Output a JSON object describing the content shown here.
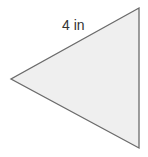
{
  "diagram": {
    "shape": "triangle",
    "side_label": "4 in",
    "fill_color": "#efefef",
    "stroke_color": "#6b6b6b",
    "vertices": [
      [
        139,
        8
      ],
      [
        11,
        79
      ],
      [
        139,
        148
      ]
    ]
  }
}
